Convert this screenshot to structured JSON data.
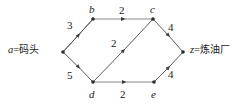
{
  "figure": {
    "background": "#ffffff",
    "edge_color": "#4a4a4a",
    "text_color": "#1a1a1a"
  },
  "endpoints": {
    "source": {
      "var": "a",
      "eq": "=",
      "name": "码头"
    },
    "sink": {
      "var": "z",
      "eq": "=",
      "name": "炼油厂"
    }
  },
  "graph_data": {
    "type": "directed-weighted-graph",
    "nodes": [
      {
        "id": "a",
        "label": "a",
        "x": 63,
        "y": 52,
        "label_shown": false
      },
      {
        "id": "b",
        "label": "b",
        "x": 93,
        "y": 19,
        "label_shown": true
      },
      {
        "id": "c",
        "label": "c",
        "x": 153,
        "y": 19,
        "label_shown": true
      },
      {
        "id": "d",
        "label": "d",
        "x": 93,
        "y": 82,
        "label_shown": true
      },
      {
        "id": "e",
        "label": "e",
        "x": 154,
        "y": 82,
        "label_shown": true
      },
      {
        "id": "z",
        "label": "z",
        "x": 183,
        "y": 52,
        "label_shown": false
      }
    ],
    "edges": [
      {
        "from": "a",
        "to": "b",
        "weight": "3",
        "wx": 69,
        "wy": 24
      },
      {
        "from": "a",
        "to": "d",
        "weight": "5",
        "wx": 69,
        "wy": 72
      },
      {
        "from": "b",
        "to": "c",
        "weight": "2",
        "wx": 120,
        "wy": 11
      },
      {
        "from": "d",
        "to": "c",
        "weight": "2",
        "wx": 112,
        "wy": 43
      },
      {
        "from": "d",
        "to": "e",
        "weight": "2",
        "wx": 121,
        "wy": 92
      },
      {
        "from": "c",
        "to": "z",
        "weight": "4",
        "wx": 170,
        "wy": 25
      },
      {
        "from": "e",
        "to": "z",
        "weight": "4",
        "wx": 170,
        "wy": 72
      }
    ]
  },
  "node_label_positions": [
    {
      "id": "b",
      "x": 89,
      "y": 5
    },
    {
      "id": "c",
      "x": 150,
      "y": 5
    },
    {
      "id": "d",
      "x": 89,
      "y": 90
    },
    {
      "id": "e",
      "x": 150,
      "y": 90
    }
  ],
  "endpoint_positions": {
    "source": {
      "x": 8,
      "y": 45
    },
    "sink": {
      "x": 190,
      "y": 45
    }
  }
}
